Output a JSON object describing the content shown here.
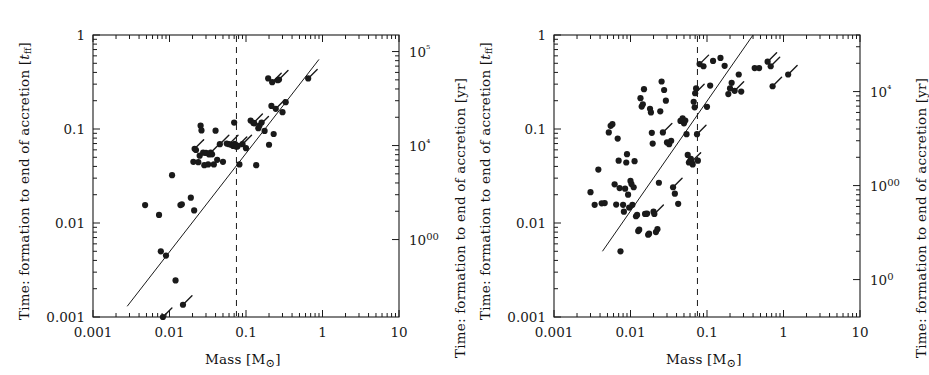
{
  "figure": {
    "kind": "two-panel-scatter",
    "background": "#ffffff",
    "ink": "#1a1a1a",
    "panels": [
      "left",
      "right"
    ]
  },
  "labels": {
    "y_left_prefix": "Time: formation to end of accretion [",
    "y_left_symbol_base": "t",
    "y_left_symbol_sub": "ff",
    "y_left_suffix": "]",
    "y_right": "Time: formation to end of accretion [yr]",
    "x_axis_prefix": "Mass [M",
    "x_axis_sun": "⊙",
    "x_axis_suffix": "]"
  },
  "chart_data": [
    {
      "panel": "left",
      "type": "scatter",
      "title": "",
      "xlabel": "Mass [M⊙]",
      "ylabel": "Time: formation to end of accretion [t_ff]",
      "y2label": "Time: formation to end of accretion [yr]",
      "xscale": "log",
      "yscale": "log",
      "xlim": [
        0.001,
        10
      ],
      "ylim": [
        0.001,
        1
      ],
      "y2lim": [
        150,
        150000
      ],
      "grid": false,
      "legend": "none",
      "xticks": [
        0.001,
        0.01,
        0.1,
        1,
        10
      ],
      "xticklabels": [
        "0.001",
        "0.01",
        "0.1",
        "1",
        "10"
      ],
      "yticks": [
        0.001,
        0.01,
        0.1,
        1
      ],
      "yticklabels": [
        "0.001",
        "0.01",
        "0.1",
        "1"
      ],
      "y2ticks": [
        1000,
        10000,
        100000
      ],
      "y2ticklabels": [
        "1000",
        "10⁴",
        "10⁵"
      ],
      "minor_ticks": true,
      "vline": {
        "x": 0.075,
        "style": "dashed",
        "label": "hydrogen burning limit"
      },
      "fitline": {
        "x": [
          0.0028,
          0.9
        ],
        "y": [
          0.0013,
          0.55
        ],
        "style": "solid"
      },
      "points": [
        {
          "x": 0.0048,
          "y": 0.0155
        },
        {
          "x": 0.0073,
          "y": 0.0122
        },
        {
          "x": 0.0077,
          "y": 0.005
        },
        {
          "x": 0.0082,
          "y": 0.001,
          "tail": true
        },
        {
          "x": 0.009,
          "y": 0.0045
        },
        {
          "x": 0.0108,
          "y": 0.0323
        },
        {
          "x": 0.012,
          "y": 0.00245
        },
        {
          "x": 0.0139,
          "y": 0.0155
        },
        {
          "x": 0.0145,
          "y": 0.0158
        },
        {
          "x": 0.015,
          "y": 0.00135,
          "tail": true
        },
        {
          "x": 0.019,
          "y": 0.0186
        },
        {
          "x": 0.021,
          "y": 0.0136
        },
        {
          "x": 0.0205,
          "y": 0.0447
        },
        {
          "x": 0.0213,
          "y": 0.0615,
          "tail": true
        },
        {
          "x": 0.0222,
          "y": 0.0598
        },
        {
          "x": 0.0238,
          "y": 0.0444
        },
        {
          "x": 0.0248,
          "y": 0.052
        },
        {
          "x": 0.0255,
          "y": 0.1085
        },
        {
          "x": 0.0262,
          "y": 0.0965
        },
        {
          "x": 0.0275,
          "y": 0.056
        },
        {
          "x": 0.0285,
          "y": 0.0412
        },
        {
          "x": 0.03,
          "y": 0.0556
        },
        {
          "x": 0.032,
          "y": 0.042
        },
        {
          "x": 0.033,
          "y": 0.0536
        },
        {
          "x": 0.0345,
          "y": 0.056,
          "tail": true
        },
        {
          "x": 0.036,
          "y": 0.0538
        },
        {
          "x": 0.038,
          "y": 0.042
        },
        {
          "x": 0.04,
          "y": 0.096
        },
        {
          "x": 0.042,
          "y": 0.047
        },
        {
          "x": 0.0455,
          "y": 0.069,
          "tail": true
        },
        {
          "x": 0.05,
          "y": 0.0448
        },
        {
          "x": 0.056,
          "y": 0.07
        },
        {
          "x": 0.06,
          "y": 0.069,
          "tail": true
        },
        {
          "x": 0.064,
          "y": 0.068
        },
        {
          "x": 0.068,
          "y": 0.066
        },
        {
          "x": 0.07,
          "y": 0.0672
        },
        {
          "x": 0.0715,
          "y": 0.0695
        },
        {
          "x": 0.073,
          "y": 0.0655
        },
        {
          "x": 0.0745,
          "y": 0.067
        },
        {
          "x": 0.076,
          "y": 0.0648
        },
        {
          "x": 0.078,
          "y": 0.066,
          "tail": true
        },
        {
          "x": 0.07,
          "y": 0.117
        },
        {
          "x": 0.082,
          "y": 0.042
        },
        {
          "x": 0.09,
          "y": 0.069,
          "tail": true
        },
        {
          "x": 0.1,
          "y": 0.0625
        },
        {
          "x": 0.115,
          "y": 0.123
        },
        {
          "x": 0.125,
          "y": 0.116,
          "tail": true
        },
        {
          "x": 0.128,
          "y": 0.115
        },
        {
          "x": 0.136,
          "y": 0.0412
        },
        {
          "x": 0.145,
          "y": 0.102
        },
        {
          "x": 0.15,
          "y": 0.109,
          "tail": true
        },
        {
          "x": 0.16,
          "y": 0.117
        },
        {
          "x": 0.175,
          "y": 0.0955
        },
        {
          "x": 0.195,
          "y": 0.345
        },
        {
          "x": 0.2,
          "y": 0.068
        },
        {
          "x": 0.215,
          "y": 0.176
        },
        {
          "x": 0.22,
          "y": 0.315,
          "tail": true
        },
        {
          "x": 0.23,
          "y": 0.0885
        },
        {
          "x": 0.245,
          "y": 0.164,
          "tail": true
        },
        {
          "x": 0.26,
          "y": 0.33
        },
        {
          "x": 0.27,
          "y": 0.336,
          "tail": true
        },
        {
          "x": 0.3,
          "y": 0.151
        },
        {
          "x": 0.33,
          "y": 0.193
        },
        {
          "x": 0.65,
          "y": 0.345,
          "tail": true
        }
      ]
    },
    {
      "panel": "right",
      "type": "scatter",
      "title": "",
      "xlabel": "Mass [M⊙]",
      "ylabel": "Time: formation to end of accretion [t_ff]",
      "y2label": "Time: formation to end of accretion [yr]",
      "xscale": "log",
      "yscale": "log",
      "xlim": [
        0.001,
        10
      ],
      "ylim": [
        0.001,
        1
      ],
      "y2lim": [
        40,
        40000
      ],
      "grid": false,
      "legend": "none",
      "xticks": [
        0.001,
        0.01,
        0.1,
        1,
        10
      ],
      "xticklabels": [
        "0.001",
        "0.01",
        "0.1",
        "1",
        "10"
      ],
      "yticks": [
        0.001,
        0.01,
        0.1,
        1
      ],
      "yticklabels": [
        "0.001",
        "0.01",
        "0.1",
        "1"
      ],
      "y2ticks": [
        100,
        1000,
        10000
      ],
      "y2ticklabels": [
        "100",
        "1000",
        "10⁴"
      ],
      "minor_ticks": true,
      "vline": {
        "x": 0.075,
        "style": "dashed",
        "label": "hydrogen burning limit"
      },
      "fitline": {
        "x": [
          0.0043,
          0.4
        ],
        "y": [
          0.005,
          1.0
        ],
        "style": "solid"
      },
      "points": [
        {
          "x": 0.003,
          "y": 0.0213
        },
        {
          "x": 0.0034,
          "y": 0.0156
        },
        {
          "x": 0.0038,
          "y": 0.037
        },
        {
          "x": 0.0042,
          "y": 0.0162
        },
        {
          "x": 0.0046,
          "y": 0.0163
        },
        {
          "x": 0.0052,
          "y": 0.092
        },
        {
          "x": 0.0055,
          "y": 0.108
        },
        {
          "x": 0.0058,
          "y": 0.1125
        },
        {
          "x": 0.0062,
          "y": 0.0258
        },
        {
          "x": 0.0065,
          "y": 0.0157
        },
        {
          "x": 0.0068,
          "y": 0.079
        },
        {
          "x": 0.007,
          "y": 0.046
        },
        {
          "x": 0.0072,
          "y": 0.0235
        },
        {
          "x": 0.0074,
          "y": 0.005
        },
        {
          "x": 0.008,
          "y": 0.0156
        },
        {
          "x": 0.0082,
          "y": 0.0132
        },
        {
          "x": 0.0085,
          "y": 0.0232
        },
        {
          "x": 0.0088,
          "y": 0.044
        },
        {
          "x": 0.009,
          "y": 0.054
        },
        {
          "x": 0.0093,
          "y": 0.02
        },
        {
          "x": 0.0096,
          "y": 0.0146
        },
        {
          "x": 0.01,
          "y": 0.028
        },
        {
          "x": 0.0103,
          "y": 0.026
        },
        {
          "x": 0.0106,
          "y": 0.0156
        },
        {
          "x": 0.011,
          "y": 0.024
        },
        {
          "x": 0.0113,
          "y": 0.0455
        },
        {
          "x": 0.0118,
          "y": 0.0118
        },
        {
          "x": 0.0122,
          "y": 0.0122
        },
        {
          "x": 0.0126,
          "y": 0.0082
        },
        {
          "x": 0.013,
          "y": 0.0085
        },
        {
          "x": 0.0135,
          "y": 0.213
        },
        {
          "x": 0.014,
          "y": 0.173
        },
        {
          "x": 0.0145,
          "y": 0.183
        },
        {
          "x": 0.015,
          "y": 0.265
        },
        {
          "x": 0.0155,
          "y": 0.0125
        },
        {
          "x": 0.016,
          "y": 0.0125
        },
        {
          "x": 0.0165,
          "y": 0.0126
        },
        {
          "x": 0.017,
          "y": 0.0075
        },
        {
          "x": 0.0175,
          "y": 0.0077
        },
        {
          "x": 0.018,
          "y": 0.164
        },
        {
          "x": 0.0185,
          "y": 0.15
        },
        {
          "x": 0.019,
          "y": 0.091
        },
        {
          "x": 0.0195,
          "y": 0.07
        },
        {
          "x": 0.02,
          "y": 0.0132
        },
        {
          "x": 0.0205,
          "y": 0.0125,
          "tail": true
        },
        {
          "x": 0.0215,
          "y": 0.008
        },
        {
          "x": 0.0225,
          "y": 0.0086
        },
        {
          "x": 0.0235,
          "y": 0.0268
        },
        {
          "x": 0.0245,
          "y": 0.154
        },
        {
          "x": 0.0255,
          "y": 0.32
        },
        {
          "x": 0.0265,
          "y": 0.092,
          "tail": true
        },
        {
          "x": 0.0275,
          "y": 0.26
        },
        {
          "x": 0.029,
          "y": 0.2
        },
        {
          "x": 0.03,
          "y": 0.072
        },
        {
          "x": 0.032,
          "y": 0.069
        },
        {
          "x": 0.034,
          "y": 0.075
        },
        {
          "x": 0.036,
          "y": 0.024,
          "tail": true
        },
        {
          "x": 0.038,
          "y": 0.0205
        },
        {
          "x": 0.042,
          "y": 0.016
        },
        {
          "x": 0.045,
          "y": 0.122
        },
        {
          "x": 0.048,
          "y": 0.13
        },
        {
          "x": 0.05,
          "y": 0.115
        },
        {
          "x": 0.052,
          "y": 0.123
        },
        {
          "x": 0.054,
          "y": 0.088
        },
        {
          "x": 0.056,
          "y": 0.053
        },
        {
          "x": 0.058,
          "y": 0.044
        },
        {
          "x": 0.06,
          "y": 0.0455
        },
        {
          "x": 0.0615,
          "y": 0.048
        },
        {
          "x": 0.063,
          "y": 0.0448,
          "tail": true
        },
        {
          "x": 0.065,
          "y": 0.042
        },
        {
          "x": 0.067,
          "y": 0.195
        },
        {
          "x": 0.069,
          "y": 0.17
        },
        {
          "x": 0.07,
          "y": 0.24,
          "tail": true
        },
        {
          "x": 0.072,
          "y": 0.27
        },
        {
          "x": 0.074,
          "y": 0.088,
          "tail": true
        },
        {
          "x": 0.076,
          "y": 0.046
        },
        {
          "x": 0.08,
          "y": 0.49,
          "tail": true
        },
        {
          "x": 0.09,
          "y": 0.465
        },
        {
          "x": 0.1,
          "y": 0.172
        },
        {
          "x": 0.11,
          "y": 0.29
        },
        {
          "x": 0.12,
          "y": 0.53
        },
        {
          "x": 0.15,
          "y": 0.57
        },
        {
          "x": 0.17,
          "y": 0.47
        },
        {
          "x": 0.19,
          "y": 0.235
        },
        {
          "x": 0.2,
          "y": 0.27
        },
        {
          "x": 0.21,
          "y": 0.31
        },
        {
          "x": 0.23,
          "y": 0.255,
          "tail": true
        },
        {
          "x": 0.26,
          "y": 0.38
        },
        {
          "x": 0.28,
          "y": 0.25
        },
        {
          "x": 0.42,
          "y": 0.445
        },
        {
          "x": 0.48,
          "y": 0.445
        },
        {
          "x": 0.62,
          "y": 0.52,
          "tail": true
        },
        {
          "x": 0.68,
          "y": 0.465,
          "tail": true
        },
        {
          "x": 0.72,
          "y": 0.285,
          "tail": true
        },
        {
          "x": 1.15,
          "y": 0.38,
          "tail": true
        }
      ]
    }
  ]
}
